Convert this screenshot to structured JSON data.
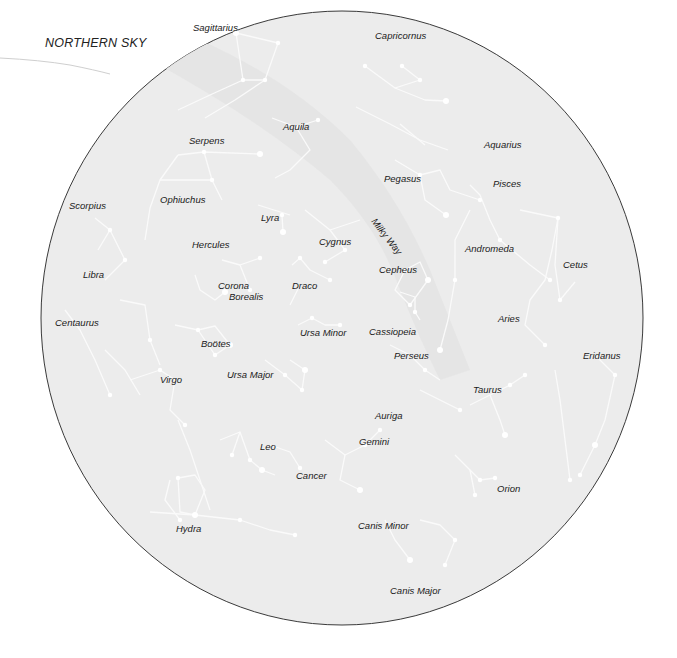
{
  "title": "NORTHERN SKY",
  "colors": {
    "background": "#ffffff",
    "disc_fill": "#ececec",
    "disc_border": "#3a3a3a",
    "milky_way": "#e2e2e2",
    "constellation_lines": "#fafafa",
    "label_text": "#1a1a1a"
  },
  "disc": {
    "cx": 342,
    "cy": 318,
    "rx": 301,
    "ry": 307
  },
  "milky_way_label": {
    "text": "Milky Way",
    "x": 378,
    "y": 216
  },
  "constellations": [
    {
      "name": "Sagittarius",
      "x": 193,
      "y": 23
    },
    {
      "name": "Capricornus",
      "x": 375,
      "y": 31
    },
    {
      "name": "Aquila",
      "x": 283,
      "y": 122
    },
    {
      "name": "Serpens",
      "x": 189,
      "y": 136
    },
    {
      "name": "Aquarius",
      "x": 484,
      "y": 140
    },
    {
      "name": "Pegasus",
      "x": 384,
      "y": 174
    },
    {
      "name": "Pisces",
      "x": 493,
      "y": 179
    },
    {
      "name": "Scorpius",
      "x": 69,
      "y": 201
    },
    {
      "name": "Ophiuchus",
      "x": 160,
      "y": 195
    },
    {
      "name": "Lyra",
      "x": 261,
      "y": 213
    },
    {
      "name": "Cygnus",
      "x": 319,
      "y": 237
    },
    {
      "name": "Andromeda",
      "x": 465,
      "y": 244
    },
    {
      "name": "Hercules",
      "x": 192,
      "y": 240
    },
    {
      "name": "Cepheus",
      "x": 379,
      "y": 265
    },
    {
      "name": "Cetus",
      "x": 563,
      "y": 260
    },
    {
      "name": "Libra",
      "x": 83,
      "y": 270
    },
    {
      "name": "Corona",
      "x": 218,
      "y": 281
    },
    {
      "name": "Borealis",
      "x": 229,
      "y": 292
    },
    {
      "name": "Draco",
      "x": 292,
      "y": 281
    },
    {
      "name": "Aries",
      "x": 498,
      "y": 314
    },
    {
      "name": "Centaurus",
      "x": 55,
      "y": 318
    },
    {
      "name": "Ursa Minor",
      "x": 300,
      "y": 328
    },
    {
      "name": "Cassiopeia",
      "x": 369,
      "y": 327
    },
    {
      "name": "Boötes",
      "x": 201,
      "y": 339
    },
    {
      "name": "Perseus",
      "x": 394,
      "y": 351
    },
    {
      "name": "Eridanus",
      "x": 583,
      "y": 351
    },
    {
      "name": "Virgo",
      "x": 160,
      "y": 375
    },
    {
      "name": "Ursa Major",
      "x": 227,
      "y": 370
    },
    {
      "name": "Taurus",
      "x": 473,
      "y": 385
    },
    {
      "name": "Auriga",
      "x": 375,
      "y": 411
    },
    {
      "name": "Gemini",
      "x": 359,
      "y": 437
    },
    {
      "name": "Leo",
      "x": 260,
      "y": 442
    },
    {
      "name": "Cancer",
      "x": 296,
      "y": 471
    },
    {
      "name": "Orion",
      "x": 497,
      "y": 484
    },
    {
      "name": "Hydra",
      "x": 176,
      "y": 524
    },
    {
      "name": "Canis Minor",
      "x": 358,
      "y": 521
    },
    {
      "name": "Canis Major",
      "x": 390,
      "y": 586
    }
  ],
  "lines": [
    [
      [
        236,
        33
      ],
      [
        278,
        43
      ],
      [
        265,
        80
      ],
      [
        243,
        80
      ],
      [
        236,
        33
      ]
    ],
    [
      [
        243,
        80
      ],
      [
        210,
        95
      ],
      [
        178,
        110
      ]
    ],
    [
      [
        265,
        80
      ],
      [
        235,
        100
      ],
      [
        205,
        118
      ]
    ],
    [
      [
        365,
        66
      ],
      [
        395,
        88
      ],
      [
        420,
        80
      ],
      [
        402,
        66
      ]
    ],
    [
      [
        395,
        88
      ],
      [
        425,
        100
      ],
      [
        446,
        101
      ]
    ],
    [
      [
        356,
        107
      ],
      [
        390,
        124
      ],
      [
        420,
        140
      ],
      [
        448,
        150
      ]
    ],
    [
      [
        400,
        124
      ],
      [
        425,
        145
      ]
    ],
    [
      [
        272,
        118
      ],
      [
        296,
        127
      ],
      [
        318,
        120
      ]
    ],
    [
      [
        296,
        127
      ],
      [
        310,
        150
      ],
      [
        290,
        170
      ],
      [
        275,
        178
      ]
    ],
    [
      [
        178,
        155
      ],
      [
        204,
        152
      ],
      [
        260,
        154
      ]
    ],
    [
      [
        204,
        152
      ],
      [
        212,
        180
      ]
    ],
    [
      [
        178,
        155
      ],
      [
        160,
        180
      ],
      [
        150,
        208
      ],
      [
        145,
        240
      ]
    ],
    [
      [
        160,
        180
      ],
      [
        212,
        180
      ],
      [
        222,
        200
      ]
    ],
    [
      [
        95,
        218
      ],
      [
        110,
        230
      ],
      [
        125,
        260
      ],
      [
        105,
        280
      ]
    ],
    [
      [
        110,
        230
      ],
      [
        98,
        250
      ]
    ],
    [
      [
        258,
        205
      ],
      [
        290,
        215
      ]
    ],
    [
      [
        282,
        215
      ],
      [
        283,
        232
      ]
    ],
    [
      [
        305,
        210
      ],
      [
        330,
        230
      ],
      [
        345,
        250
      ],
      [
        325,
        262
      ]
    ],
    [
      [
        330,
        230
      ],
      [
        360,
        220
      ]
    ],
    [
      [
        395,
        160
      ],
      [
        420,
        175
      ],
      [
        440,
        170
      ],
      [
        450,
        190
      ],
      [
        480,
        200
      ]
    ],
    [
      [
        420,
        175
      ],
      [
        425,
        200
      ],
      [
        446,
        215
      ]
    ],
    [
      [
        470,
        185
      ],
      [
        480,
        195
      ],
      [
        490,
        220
      ],
      [
        500,
        240
      ],
      [
        530,
        265
      ],
      [
        550,
        280
      ]
    ],
    [
      [
        470,
        210
      ],
      [
        455,
        240
      ],
      [
        455,
        280
      ],
      [
        448,
        320
      ],
      [
        440,
        350
      ]
    ],
    [
      [
        520,
        210
      ],
      [
        558,
        218
      ],
      [
        555,
        265
      ],
      [
        560,
        300
      ]
    ],
    [
      [
        558,
        218
      ],
      [
        552,
        250
      ],
      [
        545,
        280
      ],
      [
        530,
        300
      ],
      [
        525,
        325
      ],
      [
        545,
        345
      ]
    ],
    [
      [
        560,
        300
      ],
      [
        575,
        282
      ]
    ],
    [
      [
        405,
        270
      ],
      [
        420,
        262
      ],
      [
        428,
        280
      ],
      [
        410,
        305
      ],
      [
        395,
        290
      ],
      [
        405,
        270
      ]
    ],
    [
      [
        400,
        292
      ],
      [
        415,
        297
      ],
      [
        415,
        312
      ],
      [
        420,
        320
      ]
    ],
    [
      [
        222,
        260
      ],
      [
        240,
        265
      ],
      [
        250,
        290
      ]
    ],
    [
      [
        240,
        265
      ],
      [
        260,
        258
      ]
    ],
    [
      [
        195,
        275
      ],
      [
        200,
        290
      ],
      [
        215,
        300
      ],
      [
        225,
        292
      ]
    ],
    [
      [
        292,
        265
      ],
      [
        300,
        258
      ],
      [
        310,
        270
      ],
      [
        330,
        280
      ]
    ],
    [
      [
        290,
        305
      ],
      [
        300,
        285
      ]
    ],
    [
      [
        298,
        325
      ],
      [
        312,
        318
      ],
      [
        325,
        325
      ],
      [
        340,
        325
      ]
    ],
    [
      [
        265,
        360
      ],
      [
        285,
        375
      ],
      [
        302,
        390
      ],
      [
        305,
        370
      ],
      [
        290,
        360
      ]
    ],
    [
      [
        198,
        330
      ],
      [
        215,
        326
      ],
      [
        230,
        345
      ],
      [
        215,
        355
      ],
      [
        198,
        330
      ]
    ],
    [
      [
        175,
        325
      ],
      [
        198,
        330
      ]
    ],
    [
      [
        120,
        300
      ],
      [
        145,
        305
      ],
      [
        150,
        340
      ],
      [
        160,
        365
      ]
    ],
    [
      [
        65,
        310
      ],
      [
        80,
        330
      ],
      [
        95,
        360
      ],
      [
        110,
        395
      ]
    ],
    [
      [
        130,
        380
      ],
      [
        160,
        370
      ],
      [
        175,
        380
      ],
      [
        170,
        410
      ],
      [
        185,
        425
      ]
    ],
    [
      [
        105,
        350
      ],
      [
        125,
        370
      ],
      [
        140,
        395
      ]
    ],
    [
      [
        178,
        420
      ],
      [
        190,
        450
      ],
      [
        200,
        480
      ],
      [
        210,
        510
      ]
    ],
    [
      [
        220,
        440
      ],
      [
        240,
        432
      ],
      [
        250,
        460
      ],
      [
        262,
        470
      ],
      [
        275,
        475
      ]
    ],
    [
      [
        240,
        432
      ],
      [
        232,
        455
      ]
    ],
    [
      [
        270,
        445
      ],
      [
        290,
        452
      ],
      [
        300,
        468
      ]
    ],
    [
      [
        178,
        478
      ],
      [
        195,
        475
      ],
      [
        205,
        490
      ],
      [
        195,
        515
      ],
      [
        180,
        512
      ],
      [
        178,
        478
      ]
    ],
    [
      [
        150,
        512
      ],
      [
        195,
        515
      ],
      [
        240,
        520
      ],
      [
        270,
        530
      ],
      [
        295,
        535
      ]
    ],
    [
      [
        325,
        440
      ],
      [
        345,
        455
      ],
      [
        365,
        445
      ],
      [
        380,
        430
      ]
    ],
    [
      [
        345,
        455
      ],
      [
        340,
        480
      ],
      [
        360,
        490
      ]
    ],
    [
      [
        390,
        345
      ],
      [
        410,
        355
      ],
      [
        425,
        370
      ],
      [
        440,
        380
      ]
    ],
    [
      [
        420,
        390
      ],
      [
        440,
        400
      ],
      [
        460,
        410
      ]
    ],
    [
      [
        470,
        405
      ],
      [
        490,
        395
      ],
      [
        510,
        385
      ],
      [
        525,
        375
      ]
    ],
    [
      [
        490,
        395
      ],
      [
        500,
        420
      ],
      [
        505,
        435
      ]
    ],
    [
      [
        455,
        455
      ],
      [
        470,
        470
      ],
      [
        480,
        480
      ],
      [
        495,
        478
      ]
    ],
    [
      [
        470,
        470
      ],
      [
        475,
        495
      ]
    ],
    [
      [
        595,
        355
      ],
      [
        615,
        375
      ],
      [
        605,
        420
      ],
      [
        595,
        445
      ],
      [
        580,
        475
      ]
    ],
    [
      [
        555,
        370
      ],
      [
        560,
        400
      ],
      [
        565,
        440
      ],
      [
        570,
        480
      ]
    ],
    [
      [
        420,
        520
      ],
      [
        440,
        525
      ],
      [
        455,
        540
      ],
      [
        445,
        565
      ]
    ],
    [
      [
        385,
        520
      ],
      [
        395,
        540
      ],
      [
        410,
        560
      ]
    ],
    [
      [
        170,
        480
      ],
      [
        165,
        500
      ],
      [
        180,
        520
      ]
    ]
  ],
  "stars": [
    [
      236,
      33
    ],
    [
      278,
      43
    ],
    [
      265,
      80
    ],
    [
      243,
      80
    ],
    [
      402,
      66
    ],
    [
      446,
      101
    ],
    [
      420,
      80
    ],
    [
      365,
      66
    ],
    [
      296,
      127
    ],
    [
      318,
      120
    ],
    [
      260,
      154
    ],
    [
      204,
      152
    ],
    [
      212,
      180
    ],
    [
      110,
      230
    ],
    [
      125,
      260
    ],
    [
      283,
      232
    ],
    [
      282,
      215
    ],
    [
      345,
      250
    ],
    [
      325,
      262
    ],
    [
      420,
      175
    ],
    [
      446,
      215
    ],
    [
      480,
      200
    ],
    [
      500,
      240
    ],
    [
      550,
      280
    ],
    [
      455,
      280
    ],
    [
      440,
      350
    ],
    [
      558,
      218
    ],
    [
      560,
      300
    ],
    [
      545,
      345
    ],
    [
      405,
      270
    ],
    [
      428,
      280
    ],
    [
      410,
      305
    ],
    [
      415,
      312
    ],
    [
      250,
      290
    ],
    [
      260,
      258
    ],
    [
      225,
      292
    ],
    [
      330,
      280
    ],
    [
      300,
      258
    ],
    [
      340,
      325
    ],
    [
      312,
      318
    ],
    [
      305,
      370
    ],
    [
      302,
      390
    ],
    [
      285,
      375
    ],
    [
      215,
      355
    ],
    [
      198,
      330
    ],
    [
      230,
      345
    ],
    [
      150,
      340
    ],
    [
      110,
      395
    ],
    [
      160,
      370
    ],
    [
      185,
      425
    ],
    [
      262,
      470
    ],
    [
      250,
      460
    ],
    [
      232,
      455
    ],
    [
      300,
      468
    ],
    [
      178,
      478
    ],
    [
      195,
      515
    ],
    [
      240,
      520
    ],
    [
      295,
      535
    ],
    [
      365,
      445
    ],
    [
      380,
      430
    ],
    [
      360,
      490
    ],
    [
      425,
      370
    ],
    [
      460,
      410
    ],
    [
      510,
      385
    ],
    [
      525,
      375
    ],
    [
      505,
      435
    ],
    [
      480,
      480
    ],
    [
      495,
      478
    ],
    [
      475,
      495
    ],
    [
      615,
      375
    ],
    [
      595,
      445
    ],
    [
      580,
      475
    ],
    [
      570,
      480
    ],
    [
      455,
      540
    ],
    [
      445,
      565
    ],
    [
      410,
      560
    ],
    [
      180,
      520
    ]
  ]
}
